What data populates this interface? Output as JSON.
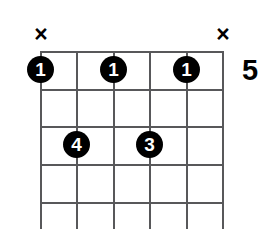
{
  "diagram": {
    "type": "guitar-chord-diagram",
    "strings_count": 6,
    "frets_shown": 5,
    "position_label": "5",
    "grid": {
      "left": 40,
      "right": 222,
      "top": 51,
      "string_spacing": 36.4,
      "fret_spacing": 37.8,
      "fret_lines_y": [
        51,
        89,
        126,
        164,
        202
      ],
      "string_lines_x": [
        40,
        76,
        113,
        149,
        186,
        222
      ],
      "line_color": "#58585a"
    },
    "string_markers": [
      {
        "string": 1,
        "symbol": "×",
        "name": "mute-marker-string-1"
      },
      {
        "string": 6,
        "symbol": "×",
        "name": "mute-marker-string-6"
      }
    ],
    "finger_dots": [
      {
        "string": 1,
        "fret": 1,
        "finger": "1",
        "x": 40,
        "y": 70
      },
      {
        "string": 3,
        "fret": 1,
        "finger": "1",
        "x": 113,
        "y": 70
      },
      {
        "string": 5,
        "fret": 1,
        "finger": "1",
        "x": 186,
        "y": 70
      },
      {
        "string": 2,
        "fret": 3,
        "finger": "4",
        "x": 76,
        "y": 145
      },
      {
        "string": 4,
        "fret": 3,
        "finger": "3",
        "x": 149,
        "y": 145
      }
    ],
    "colors": {
      "background": "#ffffff",
      "grid": "#58585a",
      "dot_fill": "#000000",
      "dot_text": "#ffffff",
      "marker": "#000000"
    }
  }
}
